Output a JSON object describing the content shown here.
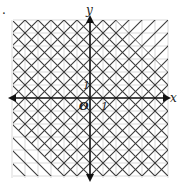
{
  "figure": {
    "marker": ".",
    "x_label": "x",
    "y_label": "y",
    "origin_label": "O",
    "x_tick_label": "1",
    "y_tick_label": "1"
  },
  "graph": {
    "description": "Graph of a system of linear inequalities with diagonal hatching; crosshatched square region between lines y = x + 4, y = x - 4, y = -x + 4, y = -x - 4",
    "grid_min": -6,
    "grid_max": 6,
    "shading": [
      {
        "region": "y <= x + 4 (outside strip, upper-left)",
        "hatch": "/"
      },
      {
        "region": "y >= -x - 4 ...",
        "hatch": "\\"
      }
    ],
    "colors": {
      "grid": "#c8c8c8",
      "hatch": "#3a3a3a",
      "axis": "#111111"
    }
  }
}
